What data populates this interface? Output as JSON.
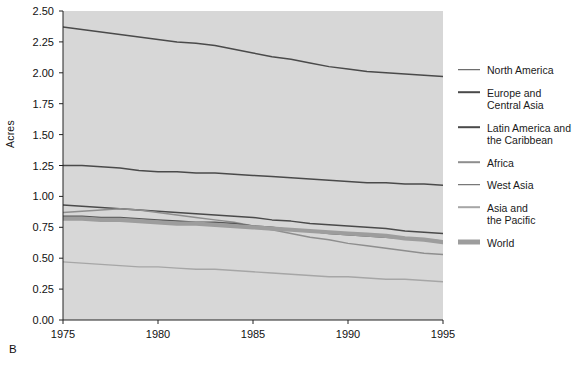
{
  "figure": {
    "panel_letter": "B",
    "background": "#d9d9d9",
    "plot_bg": "#d7d7d7"
  },
  "chart_data": {
    "type": "line",
    "title": "",
    "xlabel": "",
    "ylabel": "Acres",
    "xlim": [
      1975,
      1995
    ],
    "ylim": [
      0.0,
      2.5
    ],
    "xticks": [
      1975,
      1980,
      1985,
      1990,
      1995
    ],
    "yticks": [
      "0.00",
      "0.25",
      "0.50",
      "0.75",
      "1.00",
      "1.25",
      "1.50",
      "1.75",
      "2.00",
      "2.25",
      "2.50"
    ],
    "grid": false,
    "legend_position": "right",
    "x": [
      1975,
      1976,
      1977,
      1978,
      1979,
      1980,
      1981,
      1982,
      1983,
      1984,
      1985,
      1986,
      1987,
      1988,
      1989,
      1990,
      1991,
      1992,
      1993,
      1994,
      1995
    ],
    "series": [
      {
        "name": "North America",
        "color": "#4a4a4a",
        "width": 1.5,
        "values": [
          2.37,
          2.35,
          2.33,
          2.31,
          2.29,
          2.27,
          2.25,
          2.24,
          2.22,
          2.19,
          2.16,
          2.13,
          2.11,
          2.08,
          2.05,
          2.03,
          2.01,
          2.0,
          1.99,
          1.98,
          1.97
        ]
      },
      {
        "name": "Europe and Central Asia",
        "color": "#4a4a4a",
        "width": 1.5,
        "values": [
          1.25,
          1.25,
          1.24,
          1.23,
          1.21,
          1.2,
          1.2,
          1.19,
          1.19,
          1.18,
          1.17,
          1.16,
          1.15,
          1.14,
          1.13,
          1.12,
          1.11,
          1.11,
          1.1,
          1.1,
          1.09
        ]
      },
      {
        "name": "Latin America and the Caribbean",
        "color": "#4a4a4a",
        "width": 1.5,
        "values": [
          0.93,
          0.92,
          0.91,
          0.9,
          0.89,
          0.88,
          0.87,
          0.86,
          0.85,
          0.84,
          0.83,
          0.81,
          0.8,
          0.78,
          0.77,
          0.76,
          0.75,
          0.74,
          0.72,
          0.71,
          0.7
        ]
      },
      {
        "name": "Africa",
        "color": "#8e8e8e",
        "width": 1.5,
        "values": [
          0.87,
          0.88,
          0.89,
          0.9,
          0.89,
          0.87,
          0.85,
          0.83,
          0.81,
          0.79,
          0.76,
          0.73,
          0.7,
          0.67,
          0.65,
          0.62,
          0.6,
          0.58,
          0.56,
          0.54,
          0.53
        ]
      },
      {
        "name": "West Asia",
        "color": "#575757",
        "width": 1.5,
        "values": [
          0.84,
          0.84,
          0.83,
          0.83,
          0.82,
          0.81,
          0.8,
          0.79,
          0.79,
          0.78,
          0.76,
          0.75,
          0.73,
          0.72,
          0.7,
          0.69,
          0.68,
          0.67,
          0.66,
          0.65,
          0.64
        ]
      },
      {
        "name": "Asia and the Pacific",
        "color": "#a6a6a6",
        "width": 1.4,
        "values": [
          0.47,
          0.46,
          0.45,
          0.44,
          0.43,
          0.43,
          0.42,
          0.41,
          0.41,
          0.4,
          0.39,
          0.38,
          0.37,
          0.36,
          0.35,
          0.35,
          0.34,
          0.33,
          0.33,
          0.32,
          0.31
        ]
      },
      {
        "name": "World",
        "color": "#9d9d9d",
        "width": 4.2,
        "values": [
          0.82,
          0.82,
          0.81,
          0.81,
          0.8,
          0.79,
          0.78,
          0.78,
          0.77,
          0.76,
          0.75,
          0.74,
          0.73,
          0.72,
          0.71,
          0.7,
          0.69,
          0.68,
          0.66,
          0.65,
          0.63
        ]
      }
    ]
  },
  "legend": {
    "items": [
      {
        "label": "North America",
        "color": "#4a4a4a",
        "thick": false
      },
      {
        "label": "Europe and\nCentral Asia",
        "color": "#4a4a4a",
        "thick": false
      },
      {
        "label": "Latin America and\nthe Caribbean",
        "color": "#4a4a4a",
        "thick": false
      },
      {
        "label": "Africa",
        "color": "#8e8e8e",
        "thick": false
      },
      {
        "label": "West Asia",
        "color": "#575757",
        "thick": false
      },
      {
        "label": "Asia and\nthe Pacific",
        "color": "#a6a6a6",
        "thick": false
      },
      {
        "label": "World",
        "color": "#9d9d9d",
        "thick": true
      }
    ]
  }
}
